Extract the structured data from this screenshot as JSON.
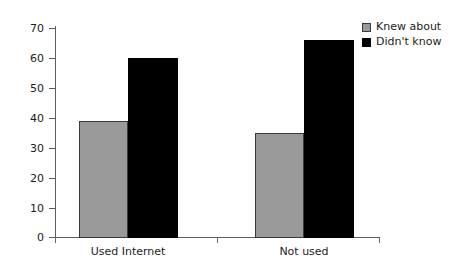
{
  "chart_data": {
    "type": "bar",
    "title": "",
    "subtitle": "",
    "xlabel": "",
    "ylabel": "",
    "categories": [
      "Used Internet",
      "Not used"
    ],
    "series": [
      {
        "name": "Knew about",
        "color": "#9a9a9a",
        "values": [
          39,
          35
        ]
      },
      {
        "name": "Didn't know",
        "color": "#000000",
        "values": [
          60,
          66
        ]
      }
    ],
    "ylim": [
      0,
      70
    ],
    "yticks": [
      0,
      10,
      20,
      30,
      40,
      50,
      60,
      70
    ],
    "ytick_labels": [
      "0",
      "10",
      "20",
      "30",
      "40",
      "50",
      "60",
      "70"
    ],
    "grid": false,
    "legend_position": "top-right"
  },
  "legend": {
    "entries": [
      {
        "label": "Knew about",
        "color": "#9a9a9a"
      },
      {
        "label": "Didn't know",
        "color": "#000000"
      }
    ]
  },
  "axis": {
    "y_labels": [
      "70",
      "60",
      "50",
      "40",
      "30",
      "20",
      "10",
      "0"
    ],
    "x_labels": [
      "Used Internet",
      "Not used"
    ]
  }
}
